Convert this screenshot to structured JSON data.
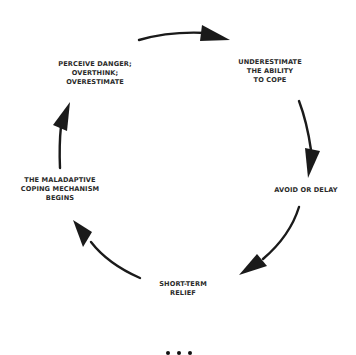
{
  "diagram": {
    "type": "cycle",
    "colors": {
      "ink": "#1a1a1a",
      "text": "#2a2a2a",
      "background": "#ffffff"
    },
    "steps": [
      {
        "id": "perceive",
        "lines": [
          "PERCEIVE DANGER;",
          "OVERTHINK;",
          "OVERESTIMATE"
        ]
      },
      {
        "id": "underestimate",
        "lines": [
          "UNDERESTIMATE",
          "THE ABILITY",
          "TO COPE"
        ]
      },
      {
        "id": "avoid",
        "lines": [
          "AVOID OR DELAY"
        ]
      },
      {
        "id": "relief",
        "lines": [
          "SHORT-TERM",
          "RELIEF"
        ]
      },
      {
        "id": "maladaptive",
        "lines": [
          "THE MALADAPTIVE",
          "COPING MECHANISM",
          "BEGINS"
        ]
      }
    ],
    "arrows": [
      {
        "from": "perceive",
        "to": "underestimate",
        "direction": "clockwise"
      },
      {
        "from": "underestimate",
        "to": "avoid",
        "direction": "clockwise"
      },
      {
        "from": "avoid",
        "to": "relief",
        "direction": "clockwise"
      },
      {
        "from": "relief",
        "to": "maladaptive",
        "direction": "clockwise"
      },
      {
        "from": "maladaptive",
        "to": "perceive",
        "direction": "clockwise"
      }
    ],
    "more_indicator": "ellipsis-icon"
  }
}
